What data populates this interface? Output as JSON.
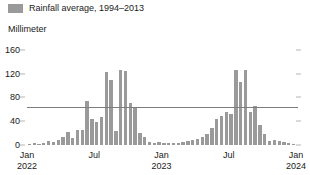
{
  "legend": {
    "swatch_color": "#9a9a9a",
    "label": "Rainfall average, 1994–2013"
  },
  "axis_unit_label": "Millimeter",
  "chart_data": {
    "type": "bar",
    "title": "",
    "subtitle": "",
    "xlabel": "",
    "ylabel": "Millimeter",
    "ylim": [
      0,
      180
    ],
    "yticks": [
      0,
      40,
      80,
      120,
      160
    ],
    "ytick_labels": [
      "0",
      "40",
      "80",
      "120",
      "160"
    ],
    "grid": false,
    "legend_position": "top-left",
    "bar_color": "#9a9a9a",
    "x_tick_labels": [
      {
        "month": "Jan",
        "year": "2022"
      },
      {
        "month": "Jul",
        "year": ""
      },
      {
        "month": "Jan",
        "year": "2023"
      },
      {
        "month": "Jul",
        "year": ""
      },
      {
        "month": "Jan",
        "year": "2024"
      }
    ],
    "series": [
      {
        "name": "Rainfall average, 1994–2013",
        "values": [
          2,
          3,
          2,
          4,
          6,
          5,
          9,
          14,
          22,
          11,
          26,
          25,
          74,
          43,
          38,
          47,
          122,
          110,
          24,
          126,
          125,
          70,
          64,
          21,
          13,
          5,
          4,
          5,
          3,
          4,
          3,
          4,
          5,
          6,
          8,
          10,
          14,
          19,
          28,
          44,
          48,
          56,
          52,
          126,
          106,
          126,
          56,
          66,
          33,
          18,
          7,
          9,
          6,
          5,
          4,
          2
        ]
      }
    ],
    "categories": [
      "2022-01-a",
      "2022-01-b",
      "2022-02-a",
      "2022-02-b",
      "2022-03-a",
      "2022-03-b",
      "2022-04-a",
      "2022-04-b",
      "2022-05-a",
      "2022-05-b",
      "2022-06-a",
      "2022-06-b",
      "2022-07-a",
      "2022-07-b",
      "2022-08-a",
      "2022-08-b",
      "2022-09-a",
      "2022-09-b",
      "2022-10-a",
      "2022-10-b",
      "2022-11-a",
      "2022-11-b",
      "2022-12-a",
      "2022-12-b",
      "2023-01-a",
      "2023-01-b",
      "2023-02-a",
      "2023-02-b",
      "2023-03-a",
      "2023-03-b",
      "2023-04-a",
      "2023-04-b",
      "2023-05-a",
      "2023-05-b",
      "2023-06-a",
      "2023-06-b",
      "2023-07-a",
      "2023-07-b",
      "2023-08-a",
      "2023-08-b",
      "2023-09-a",
      "2023-09-b",
      "2023-10-a",
      "2023-10-b",
      "2023-11-a",
      "2023-11-b",
      "2023-12-a",
      "2023-12-b",
      "2024-01-a",
      "2024-01-b",
      "2024-02-a",
      "2024-02-b",
      "2024-03-a",
      "2024-03-b",
      "2024-04-a",
      "2024-04-b"
    ]
  }
}
